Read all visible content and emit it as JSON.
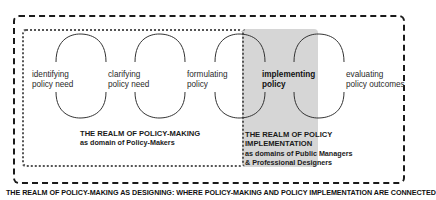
{
  "diagram": {
    "stages": [
      {
        "label_line1": "identifying",
        "label_line2": "policy need",
        "emphasis": false
      },
      {
        "label_line1": "clarifying",
        "label_line2": "policy need",
        "emphasis": false
      },
      {
        "label_line1": "formulating",
        "label_line2": "policy",
        "emphasis": false
      },
      {
        "label_line1": "implementing",
        "label_line2": "policy",
        "emphasis": true
      },
      {
        "label_line1": "evaluating",
        "label_line2": "policy outcomes",
        "emphasis": false
      }
    ],
    "realm_policy_making": {
      "title": "THE REALM OF POLICY-MAKING",
      "subtitle": "as domain of Policy-Makers"
    },
    "realm_policy_implementation": {
      "title_line1": "THE REALM OF POLICY",
      "title_line2": "IMPLEMENTATION",
      "subtitle_line1": "as domains of Public Managers",
      "subtitle_line2": "& Professional Designers"
    },
    "footer_caption": "THE REALM OF POLICY-MAKING AS DESIGNING: WHERE POLICY-MAKING AND POLICY IMPLEMENTATION ARE CONNECTED",
    "colors": {
      "implementation_fill": "#d6d6d6",
      "stroke": "#1a1a1a"
    }
  }
}
